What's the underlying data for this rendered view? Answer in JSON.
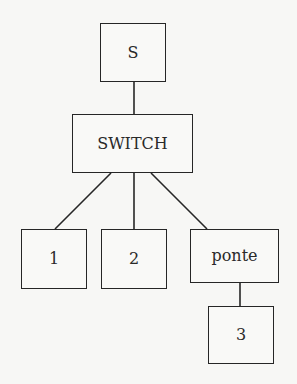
{
  "diagram": {
    "type": "tree",
    "nodes": [
      {
        "id": "s",
        "label": "S"
      },
      {
        "id": "switch",
        "label": "SWITCH"
      },
      {
        "id": "n1",
        "label": "1"
      },
      {
        "id": "n2",
        "label": "2"
      },
      {
        "id": "ponte",
        "label": "ponte"
      },
      {
        "id": "n3",
        "label": "3"
      }
    ],
    "edges": [
      {
        "from": "S",
        "to": "SWITCH"
      },
      {
        "from": "SWITCH",
        "to": "1"
      },
      {
        "from": "SWITCH",
        "to": "2"
      },
      {
        "from": "SWITCH",
        "to": "ponte"
      },
      {
        "from": "ponte",
        "to": "3"
      }
    ],
    "colors": {
      "stroke": "#262626",
      "background": "#f7f7f5"
    }
  }
}
